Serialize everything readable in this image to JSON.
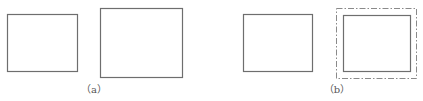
{
  "figure": {
    "panels": [
      {
        "label": "（a）",
        "shapes": [
          "solid rectangle (smaller)",
          "solid rectangle (larger)"
        ]
      },
      {
        "label": "（b）",
        "shapes": [
          "solid rectangle",
          "solid rectangle with dash-dot outline offset around it"
        ]
      }
    ],
    "colors": {
      "stroke": "#6e6e6e",
      "dash_stroke": "#8a8a8a",
      "background": "#ffffff"
    }
  }
}
